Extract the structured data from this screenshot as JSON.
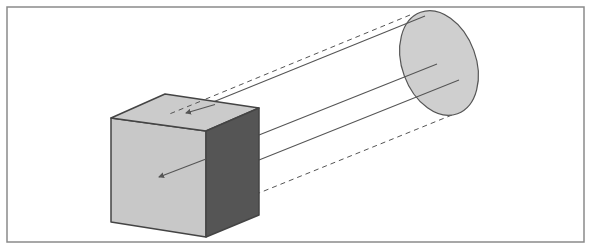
{
  "diagram": {
    "type": "projection-illustration",
    "colors": {
      "background": "#ffffff",
      "frame": "#8a8a8a",
      "cube_front": "#c8c8c8",
      "cube_top": "#cbcbcb",
      "cube_side": "#555555",
      "cube_edge": "#444444",
      "ellipse_fill": "#cfcfcf",
      "ellipse_stroke": "#555555",
      "line": "#555555"
    },
    "frame": {
      "x": 7,
      "y": 7,
      "width": 577,
      "height": 235
    },
    "cube": {
      "front": [
        [
          111,
          118
        ],
        [
          206,
          131
        ],
        [
          206,
          237
        ],
        [
          111,
          222
        ]
      ],
      "top": [
        [
          111,
          118
        ],
        [
          165,
          94
        ],
        [
          259,
          108
        ],
        [
          206,
          131
        ]
      ],
      "side": [
        [
          206,
          131
        ],
        [
          259,
          108
        ],
        [
          259,
          215
        ],
        [
          206,
          237
        ]
      ]
    },
    "ellipse": {
      "cx": 439,
      "cy": 63,
      "rx": 37,
      "ry": 54,
      "rotate": -20
    },
    "solid_rays": [
      {
        "from": [
          425,
          16
        ],
        "to": [
          186,
          113
        ],
        "arrow": true
      },
      {
        "from": [
          437,
          64
        ],
        "to": [
          259,
          135
        ],
        "arrow": false
      },
      {
        "from": [
          459,
          80
        ],
        "to": [
          259,
          160
        ],
        "arrow": false
      },
      {
        "from": [
          206,
          159
        ],
        "to": [
          159,
          177
        ],
        "arrow": true
      }
    ],
    "dashed_rays": [
      {
        "from": [
          410,
          15
        ],
        "to": [
          167,
          115
        ]
      },
      {
        "from": [
          452,
          115
        ],
        "to": [
          259,
          193
        ]
      }
    ]
  }
}
